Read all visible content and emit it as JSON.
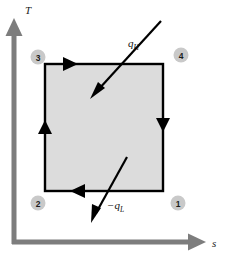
{
  "figure": {
    "type": "thermodynamic-cycle-diagram",
    "background_color": "#ffffff"
  },
  "axes": {
    "color": "#7d7d7d",
    "thickness_px": 5,
    "vertical": {
      "label": "T",
      "name": "temperature-axis",
      "x": 14,
      "y_top": 22,
      "y_bottom": 244,
      "arrow": "up"
    },
    "horizontal": {
      "label": "s",
      "name": "entropy-axis",
      "y": 242,
      "x_left": 12,
      "x_right": 203,
      "arrow": "right"
    }
  },
  "cycle_box": {
    "name": "carnot-cycle-rectangle",
    "fill_color": "#dcdcdc",
    "border_color": "#000000",
    "border_width_px": 2.2,
    "left": 45,
    "top": 64,
    "right": 163,
    "bottom": 191,
    "edges": [
      {
        "name": "process-3-to-4",
        "from": "3",
        "to": "4",
        "position": "top",
        "direction": "right",
        "description": "isothermal heat addition at high temperature"
      },
      {
        "name": "process-4-to-1",
        "from": "4",
        "to": "1",
        "position": "right",
        "direction": "down",
        "description": "isentropic expansion"
      },
      {
        "name": "process-1-to-2",
        "from": "1",
        "to": "2",
        "position": "bottom",
        "direction": "left",
        "description": "isothermal heat rejection at low temperature"
      },
      {
        "name": "process-2-to-3",
        "from": "2",
        "to": "3",
        "position": "left",
        "direction": "up",
        "description": "isentropic compression"
      }
    ]
  },
  "state_points": [
    {
      "id": "3",
      "label": "3",
      "name": "state-point-3",
      "cx": 38,
      "cy": 57,
      "corner": "top-left"
    },
    {
      "id": "4",
      "label": "4",
      "name": "state-point-4",
      "cx": 180,
      "cy": 55,
      "corner": "top-right"
    },
    {
      "id": "2",
      "label": "2",
      "name": "state-point-2",
      "cx": 38,
      "cy": 203,
      "corner": "bottom-left"
    },
    {
      "id": "1",
      "label": "1",
      "name": "state-point-1",
      "cx": 178,
      "cy": 203,
      "corner": "bottom-right"
    }
  ],
  "state_circle_style": {
    "fill_color": "#c9c9c9",
    "radius_px": 7.5
  },
  "heat_arrows": [
    {
      "name": "heat-input-arrow",
      "symbol": "q",
      "subscript": "H",
      "label_full": "qH",
      "description": "heat added into the cycle",
      "color": "#000000",
      "x1": 160,
      "y1": 22,
      "x2": 93,
      "y2": 97,
      "label_x": 128,
      "label_y": 45
    },
    {
      "name": "heat-rejected-arrow",
      "symbol": "q",
      "subscript": "L",
      "prefix": "−",
      "label_full": "−qL",
      "description": "heat rejected out of the cycle",
      "color": "#000000",
      "x1": 126,
      "y1": 158,
      "x2": 92,
      "y2": 220,
      "label_x": 108,
      "label_y": 208
    }
  ],
  "edge_arrowheads": [
    {
      "name": "top-edge-arrowhead",
      "direction": "right",
      "x": 70,
      "y": 64
    },
    {
      "name": "left-edge-arrowhead",
      "direction": "up",
      "x": 45,
      "y": 129
    },
    {
      "name": "right-edge-arrowhead",
      "direction": "down",
      "x": 163,
      "y": 124
    },
    {
      "name": "bottom-edge-arrowhead",
      "direction": "left",
      "x": 79,
      "y": 191
    }
  ]
}
